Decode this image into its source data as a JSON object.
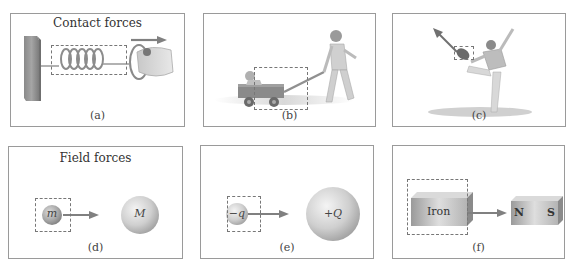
{
  "figure": {
    "row_titles": {
      "contact": "Contact forces",
      "field": "Field forces"
    },
    "panels": [
      {
        "id": "a",
        "caption": "(a)",
        "description": "hand pulling a spring attached to a wall"
      },
      {
        "id": "b",
        "caption": "(b)",
        "description": "child pulling a wagon with a baby"
      },
      {
        "id": "c",
        "caption": "(c)",
        "description": "football player kicking a ball"
      },
      {
        "id": "d",
        "caption": "(d)",
        "mass_small": "m",
        "mass_large": "M"
      },
      {
        "id": "e",
        "caption": "(e)",
        "charge_small": "−q",
        "charge_large": "+Q"
      },
      {
        "id": "f",
        "caption": "(f)",
        "object": "Iron",
        "magnet_north": "N",
        "magnet_south": "S"
      }
    ],
    "colors": {
      "panel_border": "#9a9a9a",
      "dashed_box": "#777777",
      "arrow": "#808080",
      "sphere_light": "#f0f0f0",
      "sphere_dark": "#a8a8a8"
    }
  }
}
